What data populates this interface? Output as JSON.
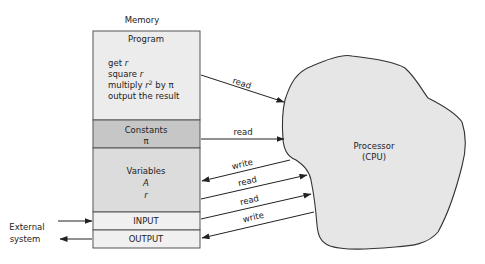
{
  "memory": {
    "title": "Memory",
    "sections": [
      {
        "id": "program",
        "label": "Program",
        "fill": "#ececec",
        "lines": [
          "get r",
          "square r",
          "multiply r² by π",
          "output the result"
        ]
      },
      {
        "id": "constants",
        "label": "Constants",
        "value": "π",
        "fill": "#c6c6c6"
      },
      {
        "id": "variables",
        "label": "Variables",
        "values": [
          "A",
          "r"
        ],
        "fill": "#dcdcdc"
      },
      {
        "id": "input",
        "label": "INPUT",
        "fill": "#f0f0f0"
      },
      {
        "id": "output",
        "label": "OUTPUT",
        "fill": "#f0f0f0"
      }
    ]
  },
  "program_text": {
    "line1_a": "get ",
    "line1_b": "r",
    "line2_a": "square ",
    "line2_b": "r",
    "line3_a": "multiply ",
    "line3_b": "r",
    "line3_sup": "2",
    "line3_c": " by π",
    "line4": "output the result"
  },
  "processor": {
    "line1": "Processor",
    "line2": "(CPU)",
    "fill": "#e6e6e6"
  },
  "external": {
    "line1": "External",
    "line2": "system"
  },
  "arrows": [
    {
      "from": "program",
      "to": "processor",
      "label": "read"
    },
    {
      "from": "constants",
      "to": "processor",
      "label": "read"
    },
    {
      "from": "processor",
      "to": "variables",
      "label": "write"
    },
    {
      "from": "variables",
      "to": "processor",
      "label": "read"
    },
    {
      "from": "input",
      "to": "processor",
      "label": "read"
    },
    {
      "from": "processor",
      "to": "output",
      "label": "write"
    },
    {
      "from": "external",
      "to": "input",
      "label": ""
    },
    {
      "from": "output",
      "to": "external",
      "label": ""
    }
  ]
}
